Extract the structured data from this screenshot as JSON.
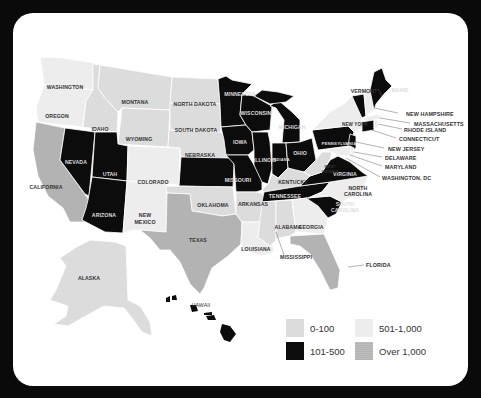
{
  "legend": {
    "items": [
      {
        "label": "0-100",
        "color": "#dcdcdc"
      },
      {
        "label": "101-500",
        "color": "#0c0c0c"
      },
      {
        "label": "501-1,000",
        "color": "#ededed"
      },
      {
        "label": "Over 1,000",
        "color": "#b3b3b3"
      }
    ]
  },
  "colors": {
    "frame": "#0a0a0a",
    "card": "#ffffff",
    "cat_0_100": "#dcdcdc",
    "cat_101_500": "#0c0c0c",
    "cat_501_1000": "#ededed",
    "cat_over_1000": "#b3b3b3"
  },
  "states": {
    "washington": {
      "label": "WASHINGTON",
      "category": "501-1,000"
    },
    "oregon": {
      "label": "OREGON",
      "category": "501-1,000"
    },
    "california": {
      "label": "CALIFORNIA",
      "category": "Over 1,000"
    },
    "idaho": {
      "label": "IDAHO",
      "category": "0-100"
    },
    "nevada": {
      "label": "NEVADA",
      "category": "101-500"
    },
    "montana": {
      "label": "MONTANA",
      "category": "0-100"
    },
    "wyoming": {
      "label": "WYOMING",
      "category": "0-100"
    },
    "utah": {
      "label": "UTAH",
      "category": "101-500"
    },
    "arizona": {
      "label": "ARIZONA",
      "category": "101-500"
    },
    "colorado": {
      "label": "COLORADO",
      "category": "501-1,000"
    },
    "new_mexico": {
      "label1": "NEW",
      "label2": "MEXICO",
      "category": "501-1,000"
    },
    "north_dakota": {
      "label": "NORTH DAKOTA",
      "category": "0-100"
    },
    "south_dakota": {
      "label": "SOUTH DAKOTA",
      "category": "0-100"
    },
    "nebraska": {
      "label": "NEBRASKA",
      "category": "0-100"
    },
    "kansas": {
      "label": "KANSAS",
      "category": "101-500"
    },
    "oklahoma": {
      "label": "OKLAHOMA",
      "category": "0-100"
    },
    "texas": {
      "label": "TEXAS",
      "category": "Over 1,000"
    },
    "minnesota": {
      "label": "MINNESOTA",
      "category": "101-500"
    },
    "iowa": {
      "label": "IOWA",
      "category": "101-500"
    },
    "missouri": {
      "label": "MISSOURI",
      "category": "101-500"
    },
    "arkansas": {
      "label": "ARKANSAS",
      "category": "0-100"
    },
    "louisiana": {
      "label": "LOUISIANA",
      "category": "501-1,000"
    },
    "wisconsin": {
      "label": "WISCONSIN",
      "category": "101-500"
    },
    "illinois": {
      "label": "ILLINOIS",
      "category": "101-500"
    },
    "michigan": {
      "label": "MICHIGAN",
      "category": "101-500"
    },
    "indiana": {
      "label": "INDIANA",
      "category": "101-500"
    },
    "ohio": {
      "label": "OHIO",
      "category": "101-500"
    },
    "kentucky": {
      "label": "KENTUCKY",
      "category": "0-100"
    },
    "tennessee": {
      "label": "TENNESSEE",
      "category": "101-500"
    },
    "mississippi": {
      "label": "MISSISSIPPI",
      "category": "0-100"
    },
    "alabama": {
      "label": "ALABAMA",
      "category": "0-100"
    },
    "georgia": {
      "label": "GEORGIA",
      "category": "501-1,000"
    },
    "florida": {
      "label": "FLORIDA",
      "category": "Over 1,000"
    },
    "south_carolina": {
      "label1": "SOUTH",
      "label2": "CAROLINA",
      "category": "101-500"
    },
    "north_carolina": {
      "label1": "NORTH",
      "label2": "CAROLINA",
      "category": "501-1,000"
    },
    "virginia": {
      "label": "VIRGINIA",
      "category": "101-500"
    },
    "west_virginia": {
      "label1": "WEST",
      "label2": "VIRGINIA",
      "category": "0-100"
    },
    "pennsylvania": {
      "label": "PENNSYLVANIA",
      "category": "101-500"
    },
    "new_york": {
      "label": "NEW YORK",
      "category": "501-1,000"
    },
    "vermont": {
      "label": "VERMONT",
      "category": "101-500"
    },
    "maine": {
      "label": "MAINE",
      "category": "101-500"
    },
    "new_hampshire": {
      "label": "NEW HAMPSHIRE",
      "category": "501-1,000"
    },
    "massachusetts": {
      "label": "MASSACHUSETTS",
      "category": "501-1,000"
    },
    "rhode_island": {
      "label": "RHODE ISLAND",
      "category": "501-1,000"
    },
    "connecticut": {
      "label": "CONNECTICUT",
      "category": "101-500"
    },
    "new_jersey": {
      "label": "NEW JERSEY",
      "category": "101-500"
    },
    "delaware": {
      "label": "DELAWARE",
      "category": "501-1,000"
    },
    "maryland": {
      "label": "MARYLAND",
      "category": "501-1,000"
    },
    "washington_dc": {
      "label": "WASHINGTON, DC",
      "category": "501-1,000"
    },
    "alaska": {
      "label": "ALASKA",
      "category": "0-100"
    },
    "hawaii": {
      "label": "HAWAII",
      "category": "101-500"
    }
  }
}
